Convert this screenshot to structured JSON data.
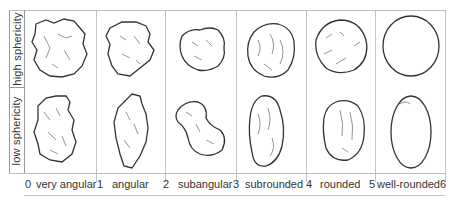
{
  "diagram": {
    "title_rows": [
      "high sphericity",
      "low sphericity"
    ],
    "columns": [
      {
        "class": "very angular",
        "start": "0",
        "end": "1"
      },
      {
        "class": "angular",
        "start": "1",
        "end": "2"
      },
      {
        "class": "subangular",
        "start": "2",
        "end": "3"
      },
      {
        "class": "subrounded",
        "start": "3",
        "end": "4"
      },
      {
        "class": "rounded",
        "start": "4",
        "end": "5"
      },
      {
        "class": "well-rounded",
        "start": "5",
        "end": "6"
      }
    ],
    "scale_labels": [
      {
        "text": "0",
        "x": 25
      },
      {
        "text": "very angular",
        "x": 36
      },
      {
        "text": "1",
        "x": 97
      },
      {
        "text": "angular",
        "x": 112
      },
      {
        "text": "2",
        "x": 163
      },
      {
        "text": "subangular",
        "x": 178
      },
      {
        "text": "3",
        "x": 233
      },
      {
        "text": "subrounded",
        "x": 245
      },
      {
        "text": "4",
        "x": 306
      },
      {
        "text": "rounded",
        "x": 320
      },
      {
        "text": "5",
        "x": 369
      },
      {
        "text": "well-rounded",
        "x": 377
      },
      {
        "text": "6",
        "x": 440
      }
    ],
    "grains": [
      {
        "row": "high sphericity",
        "column": "very angular",
        "shape": "grain-very-angular-high"
      },
      {
        "row": "high sphericity",
        "column": "angular",
        "shape": "grain-angular-high"
      },
      {
        "row": "high sphericity",
        "column": "subangular",
        "shape": "grain-subangular-high"
      },
      {
        "row": "high sphericity",
        "column": "subrounded",
        "shape": "grain-subrounded-high"
      },
      {
        "row": "high sphericity",
        "column": "rounded",
        "shape": "grain-rounded-high"
      },
      {
        "row": "high sphericity",
        "column": "well-rounded",
        "shape": "grain-well-rounded-high"
      },
      {
        "row": "low sphericity",
        "column": "very angular",
        "shape": "grain-very-angular-low"
      },
      {
        "row": "low sphericity",
        "column": "angular",
        "shape": "grain-angular-low"
      },
      {
        "row": "low sphericity",
        "column": "subangular",
        "shape": "grain-subangular-low"
      },
      {
        "row": "low sphericity",
        "column": "subrounded",
        "shape": "grain-subrounded-low"
      },
      {
        "row": "low sphericity",
        "column": "rounded",
        "shape": "grain-rounded-low"
      },
      {
        "row": "low sphericity",
        "column": "well-rounded",
        "shape": "grain-well-rounded-low"
      }
    ]
  }
}
